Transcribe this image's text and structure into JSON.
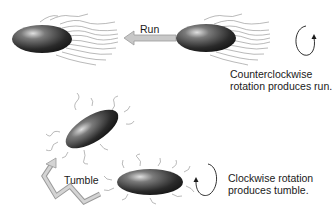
{
  "diagram": {
    "topic": "Bacterial chemotaxis: run and tumble",
    "labels": {
      "run": "Run",
      "tumble": "Tumble",
      "ccw_caption": "Counterclockwise rotation produces run.",
      "cw_caption": "Clockwise rotation produces tumble."
    },
    "elements": [
      {
        "id": "bacterium-run-left",
        "type": "bacterium",
        "flagella": "bundled-trailing"
      },
      {
        "id": "bacterium-run-right",
        "type": "bacterium",
        "flagella": "bundled-trailing"
      },
      {
        "id": "run-arrow",
        "type": "arrow",
        "direction": "left"
      },
      {
        "id": "ccw-rotation-arrow",
        "type": "rotation-arrow",
        "direction": "counterclockwise"
      },
      {
        "id": "bacterium-tumble-upper",
        "type": "bacterium",
        "flagella": "dispersed"
      },
      {
        "id": "bacterium-tumble-lower",
        "type": "bacterium",
        "flagella": "dispersed"
      },
      {
        "id": "tumble-arrow",
        "type": "zigzag-arrow",
        "direction": "up-left"
      },
      {
        "id": "cw-rotation-arrow",
        "type": "rotation-arrow",
        "direction": "clockwise"
      }
    ],
    "colors": {
      "cell_dark": "#1e1e1e",
      "cell_mid": "#5a5a5a",
      "cell_highlight": "#d8d8d8",
      "flagella": "#8a8a8a",
      "arrow_fill": "#c8c8c8",
      "arrow_stroke": "#9a9a9a",
      "text": "#1a1a1a"
    }
  }
}
